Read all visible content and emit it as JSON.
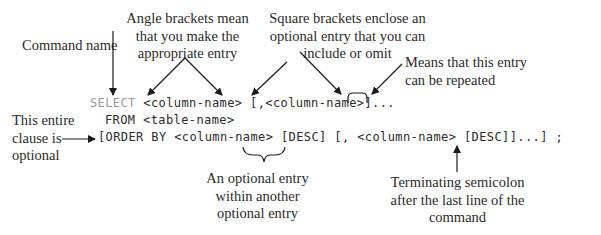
{
  "annotations": {
    "command_name": "Command name",
    "angle_brackets": [
      "Angle brackets mean",
      "that you make the",
      "appropriate entry"
    ],
    "square_brackets": [
      "Square brackets enclose an",
      "optional entry that you can",
      "include or omit"
    ],
    "repeated": [
      "Means that this entry",
      "can be repeated"
    ],
    "entire_clause": [
      "This entire",
      "clause is",
      "optional"
    ],
    "nested_optional": [
      "An optional entry",
      "within another",
      "optional entry"
    ],
    "terminating": [
      "Terminating semicolon",
      "after the last line of the",
      "command"
    ]
  },
  "syntax": {
    "line1_keyword": "SELECT",
    "line1_rest": " <column-name> [,<column-name>]...",
    "line2": "FROM <table-name>",
    "line3": "[ORDER BY <column-name> [DESC] [, <column-name> [DESC]]...] ;"
  },
  "colors": {
    "text": "#2a2a2a",
    "keyword_gray": "#9a9a9a",
    "arrow": "#1a1a1a",
    "background": "#ffffff"
  }
}
